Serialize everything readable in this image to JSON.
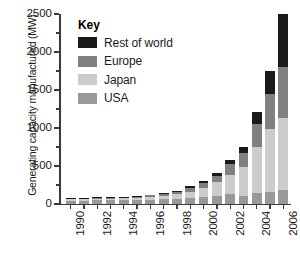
{
  "chart_data": {
    "type": "bar",
    "subtype": "stacked-bar",
    "title": "",
    "xlabel": "",
    "ylabel": "Generating capacity manufactured (MW)",
    "ylim": [
      0,
      2500
    ],
    "ytick_values": [
      0,
      500,
      1000,
      1500,
      2000,
      2500
    ],
    "ytick_labels": [
      "0",
      "500",
      "1000",
      "1500",
      "2000",
      "2500"
    ],
    "yminor_step": 250,
    "grid": false,
    "legend_position": "upper-left-inside",
    "legend_title": "Key",
    "categories": [
      "1990",
      "1991",
      "1992",
      "1993",
      "1994",
      "1995",
      "1996",
      "1997",
      "1998",
      "1999",
      "2000",
      "2001",
      "2002",
      "2003",
      "2004",
      "2005",
      "2006"
    ],
    "xtick_labels": [
      "1990",
      "1992",
      "1994",
      "1996",
      "1998",
      "2000",
      "2002",
      "2004",
      "2006"
    ],
    "xtick_label_indices": [
      0,
      2,
      4,
      6,
      8,
      10,
      12,
      14,
      16
    ],
    "series": [
      {
        "name": "USA",
        "color": "#999999",
        "values": [
          35,
          37,
          40,
          42,
          43,
          45,
          50,
          55,
          60,
          70,
          80,
          100,
          120,
          105,
          140,
          150,
          180
        ]
      },
      {
        "name": "Japan",
        "color": "#cccccc",
        "values": [
          18,
          20,
          22,
          23,
          25,
          30,
          38,
          50,
          60,
          85,
          130,
          180,
          260,
          370,
          600,
          830,
          940
        ]
      },
      {
        "name": "Europe",
        "color": "#808080",
        "values": [
          8,
          9,
          10,
          10,
          11,
          14,
          18,
          25,
          35,
          50,
          60,
          85,
          140,
          190,
          310,
          460,
          680
        ]
      },
      {
        "name": "Rest of world",
        "color": "#1a1a1a",
        "values": [
          4,
          4,
          5,
          5,
          6,
          6,
          8,
          10,
          15,
          20,
          30,
          35,
          50,
          80,
          160,
          300,
          700
        ]
      }
    ],
    "totals": [
      65,
      70,
      77,
      80,
      85,
      95,
      114,
      140,
      170,
      225,
      300,
      400,
      570,
      745,
      1210,
      1740,
      2500
    ]
  },
  "legend": {
    "title": "Key",
    "items": [
      {
        "label": "Rest of world",
        "color": "#1a1a1a"
      },
      {
        "label": "Europe",
        "color": "#808080"
      },
      {
        "label": "Japan",
        "color": "#cccccc"
      },
      {
        "label": "USA",
        "color": "#999999"
      }
    ]
  }
}
